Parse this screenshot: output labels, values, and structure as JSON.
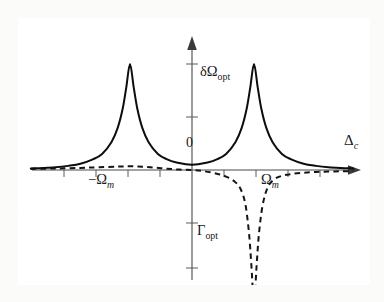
{
  "figure": {
    "background_color": "#ffffff",
    "frame_color": "#3a3a3a",
    "curve_color": "#111111",
    "axis_color": "#444444"
  },
  "labels": {
    "y_curve_solid": "δΩ",
    "y_curve_solid_sub": "opt",
    "y_curve_dashed": "Γ",
    "y_curve_dashed_sub": "opt",
    "x_axis": "Δ",
    "x_axis_sub": "c",
    "origin": "0",
    "tick_left": "−Ω",
    "tick_left_sub": "m",
    "tick_right": "Ω",
    "tick_right_sub": "m"
  },
  "chart_data": {
    "type": "line",
    "title": "",
    "xlabel": "Δ_c",
    "ylabel": "",
    "grid": false,
    "legend": "inline-annotations",
    "xlim": [
      -2.6,
      2.6
    ],
    "ylim": [
      -1.35,
      1.15
    ],
    "xticks": [
      -2.0,
      -1.5,
      -1.0,
      -0.5,
      0.5,
      1.0,
      1.5,
      2.0
    ],
    "xtick_labels": [
      "",
      "",
      "−Ω_m",
      "",
      "",
      "Ω_m",
      "",
      ""
    ],
    "yticks": [
      -1.0,
      -0.5,
      0.5,
      1.0
    ],
    "ytick_labels": [
      "",
      "",
      "",
      ""
    ],
    "annotations": [
      {
        "text": "δΩ_opt",
        "x": 0.42,
        "y": 0.72
      },
      {
        "text": "Γ_opt",
        "x": 0.36,
        "y": -0.62
      },
      {
        "text": "0",
        "x": -0.12,
        "y": 0.1
      }
    ],
    "series": [
      {
        "name": "δΩ_opt",
        "style": "solid",
        "description": "Optical spring shift: two positive Lorentzian peaks centered at −Ω_m and +Ω_m",
        "peaks": [
          {
            "center": -1.0,
            "height": 1.0,
            "hwhm": 0.16
          },
          {
            "center": 1.0,
            "height": 1.0,
            "hwhm": 0.16
          }
        ],
        "x": [
          -2.6,
          -2.4,
          -2.2,
          -2.0,
          -1.8,
          -1.6,
          -1.45,
          -1.3,
          -1.2,
          -1.12,
          -1.06,
          -1.0,
          -0.94,
          -0.88,
          -0.8,
          -0.7,
          -0.55,
          -0.4,
          -0.25,
          -0.1,
          0.0,
          0.1,
          0.25,
          0.4,
          0.55,
          0.7,
          0.8,
          0.88,
          0.94,
          1.0,
          1.06,
          1.12,
          1.2,
          1.3,
          1.45,
          1.6,
          1.8,
          2.0,
          2.2,
          2.4,
          2.6
        ],
        "y": [
          0.015,
          0.019,
          0.026,
          0.039,
          0.059,
          0.1,
          0.151,
          0.262,
          0.395,
          0.573,
          0.78,
          1.0,
          0.78,
          0.573,
          0.395,
          0.262,
          0.151,
          0.1,
          0.07,
          0.054,
          0.05,
          0.054,
          0.07,
          0.1,
          0.151,
          0.262,
          0.395,
          0.573,
          0.78,
          1.0,
          0.78,
          0.573,
          0.395,
          0.262,
          0.151,
          0.1,
          0.059,
          0.039,
          0.026,
          0.019,
          0.015
        ]
      },
      {
        "name": "Γ_opt",
        "style": "dashed",
        "description": "Optical damping: near zero for Δ_c < 0, deep narrow negative dip centered at +Ω_m",
        "dip": {
          "center": 1.0,
          "depth": -1.28,
          "hwhm": 0.13
        },
        "x": [
          -2.6,
          -2.2,
          -1.8,
          -1.5,
          -1.2,
          -1.0,
          -0.8,
          -0.6,
          -0.4,
          -0.2,
          0.0,
          0.2,
          0.4,
          0.55,
          0.68,
          0.78,
          0.86,
          0.92,
          0.96,
          1.0,
          1.04,
          1.08,
          1.14,
          1.22,
          1.32,
          1.45,
          1.6,
          1.8,
          2.0,
          2.2,
          2.4,
          2.6
        ],
        "y": [
          0.01,
          0.014,
          0.02,
          0.026,
          0.032,
          0.035,
          0.03,
          0.022,
          0.012,
          0.004,
          0.0,
          -0.012,
          -0.035,
          -0.062,
          -0.105,
          -0.175,
          -0.32,
          -0.6,
          -0.92,
          -1.28,
          -0.92,
          -0.6,
          -0.33,
          -0.165,
          -0.09,
          -0.055,
          -0.038,
          -0.026,
          -0.019,
          -0.015,
          -0.012,
          -0.01
        ]
      }
    ]
  }
}
